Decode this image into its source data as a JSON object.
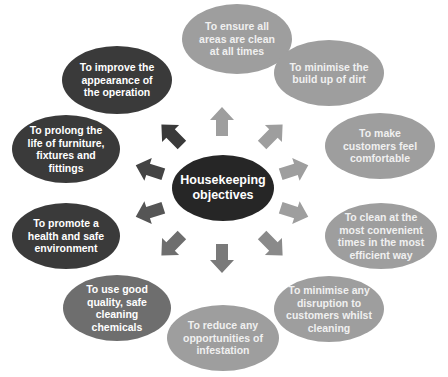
{
  "diagram": {
    "center": {
      "label_line1": "Housekeeping",
      "label_line2": "objectives"
    },
    "objectives": [
      {
        "id": "ensure-clean",
        "text": "To ensure all areas are clean at all times",
        "shade": "light"
      },
      {
        "id": "minimise-dirt",
        "text": "To minimise the build up of dirt",
        "shade": "light"
      },
      {
        "id": "customers-comfortable",
        "text": "To make customers feel comfortable",
        "shade": "light"
      },
      {
        "id": "clean-convenient",
        "text": "To clean at the most convenient times in the most efficient way",
        "shade": "light"
      },
      {
        "id": "minimise-disruption",
        "text": "To minimise any disruption to customers whilst cleaning",
        "shade": "light"
      },
      {
        "id": "reduce-infestation",
        "text": "To reduce any opportunities of infestation",
        "shade": "light"
      },
      {
        "id": "good-chemicals",
        "text": "To use good quality, safe cleaning chemicals",
        "shade": "mid"
      },
      {
        "id": "health-safe",
        "text": "To promote a health and safe environment",
        "shade": "dark"
      },
      {
        "id": "prolong-life",
        "text": "To prolong the life of furniture, fixtures and fittings",
        "shade": "dark"
      },
      {
        "id": "improve-appearance",
        "text": "To improve the appearance of the operation",
        "shade": "dark"
      }
    ],
    "colors": {
      "center": "#262626",
      "dark": "#3a3a3a",
      "mid": "#6e6e6e",
      "light": "#9e9e9e"
    }
  }
}
